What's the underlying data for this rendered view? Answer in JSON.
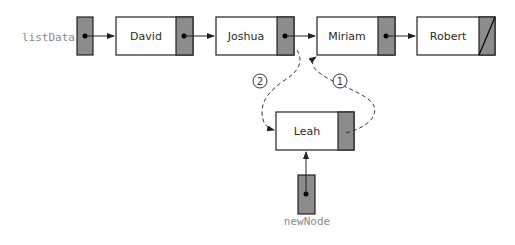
{
  "variables": {
    "list_head": "listData",
    "new_node": "newNode"
  },
  "nodes": [
    {
      "id": "david",
      "label": "David"
    },
    {
      "id": "joshua",
      "label": "Joshua"
    },
    {
      "id": "miriam",
      "label": "Miriam"
    },
    {
      "id": "robert",
      "label": "Robert",
      "next": "null"
    }
  ],
  "inserted_node": {
    "id": "leah",
    "label": "Leah"
  },
  "steps": [
    {
      "number": "1",
      "description": "Leah.next -> Miriam"
    },
    {
      "number": "2",
      "description": "Joshua.next -> Leah"
    }
  ],
  "colors": {
    "pointer_fill": "#8c8c8c",
    "border": "#222222",
    "arrow": "#222222"
  }
}
